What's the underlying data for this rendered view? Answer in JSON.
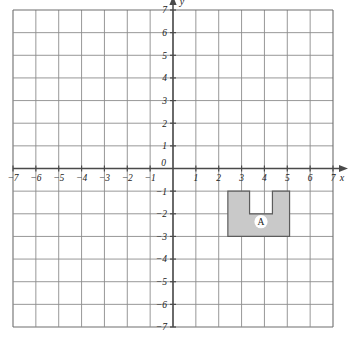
{
  "figure": {
    "type": "coordinate-grid",
    "background_color": "#ffffff",
    "grid_color": "#8c8c8c",
    "axis_color": "#4a4a4a"
  },
  "axes": {
    "x_label": "x",
    "y_label": "y",
    "origin_label": "0",
    "x_min": -7,
    "x_max": 7,
    "y_min": -7,
    "y_max": 7,
    "x_tick_labels": [
      "−7",
      "−6",
      "−5",
      "−4",
      "−3",
      "−2",
      "−1",
      "1",
      "2",
      "3",
      "4",
      "5",
      "6",
      "7"
    ],
    "y_tick_labels_up": [
      "1",
      "2",
      "3",
      "4",
      "5",
      "6",
      "7"
    ],
    "y_tick_labels_down": [
      "−1",
      "−2",
      "−3",
      "−4",
      "−5",
      "−6",
      "−7"
    ]
  },
  "chart_data": {
    "type": "scatter",
    "title": "",
    "xlabel": "x",
    "ylabel": "y",
    "xlim": [
      -7,
      7
    ],
    "ylim": [
      -7,
      7
    ],
    "grid": true,
    "legend": "none",
    "xticks": [
      -7,
      -6,
      -5,
      -4,
      -3,
      -2,
      -1,
      0,
      1,
      2,
      3,
      4,
      5,
      6,
      7
    ],
    "yticks": [
      -7,
      -6,
      -5,
      -4,
      -3,
      -2,
      -1,
      0,
      1,
      2,
      3,
      4,
      5,
      6,
      7
    ],
    "shapes": [
      {
        "name": "A",
        "label": "A",
        "fill": "#c9c9c9",
        "stroke": "#5c5c5c",
        "label_point": [
          3.85,
          -2.35
        ],
        "vertices": [
          [
            2.4,
            -1.0
          ],
          [
            3.35,
            -1.0
          ],
          [
            3.35,
            -2.0
          ],
          [
            4.35,
            -2.0
          ],
          [
            4.35,
            -1.0
          ],
          [
            5.1,
            -1.0
          ],
          [
            5.1,
            -3.0
          ],
          [
            2.4,
            -3.0
          ]
        ]
      }
    ]
  }
}
